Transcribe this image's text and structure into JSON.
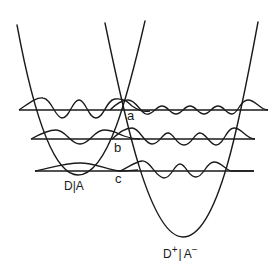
{
  "diagram": {
    "type": "potential-energy-surfaces",
    "left_well": {
      "label": "D|A",
      "vertex": [
        78,
        175
      ],
      "top_left": [
        17,
        25
      ],
      "top_right": [
        145,
        21
      ]
    },
    "right_well": {
      "label_base_d": "D",
      "label_sup_d": "+",
      "label_sep": "|",
      "label_base_a": "A",
      "label_sup_a": "−",
      "vertex": [
        183,
        237
      ],
      "top_left": [
        105,
        23
      ],
      "top_right": [
        258,
        22
      ]
    },
    "levels": [
      {
        "id": "a",
        "label": "a",
        "y": 110,
        "x_start": 19,
        "x_end": 268
      },
      {
        "id": "b",
        "label": "b",
        "y": 139,
        "x_start": 31,
        "x_end": 255
      },
      {
        "id": "c",
        "label": "c",
        "y": 171,
        "x_start": 35,
        "x_end": 254
      }
    ],
    "line_color": "#1a1a1a",
    "background": "#ffffff"
  }
}
